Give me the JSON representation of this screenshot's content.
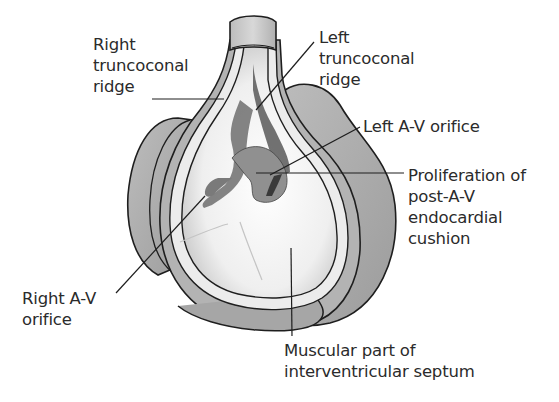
{
  "figure": {
    "labels": {
      "right_truncoconal_ridge": [
        "Right",
        "truncoconal",
        "ridge"
      ],
      "left_truncoconal_ridge": [
        "Left",
        "truncoconal",
        "ridge"
      ],
      "left_av_orifice": [
        "Left A-V orifice"
      ],
      "proliferation": [
        "Proliferation of",
        "post-A-V",
        "endocardial",
        "cushion"
      ],
      "right_av_orifice": [
        "Right A-V",
        "orifice"
      ],
      "muscular_septum": [
        "Muscular part of",
        "interventricular septum"
      ]
    },
    "colors": {
      "outline": "#1e1e1e",
      "outer_wall": "#a9a9a9",
      "inner_wall": "#d6d6d6",
      "cavity": "#f3f3f3",
      "cushion": "#8f8f8f",
      "dark_ridge": "#555555",
      "text": "#2b2b2b"
    }
  }
}
